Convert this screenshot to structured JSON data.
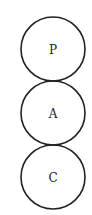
{
  "diagram": {
    "nodes": [
      {
        "id": "p",
        "label": "P",
        "cx": 53,
        "cy": 49,
        "r": 32
      },
      {
        "id": "a",
        "label": "A",
        "cx": 53,
        "cy": 113,
        "r": 32
      },
      {
        "id": "c",
        "label": "C",
        "cx": 53,
        "cy": 177,
        "r": 32
      }
    ],
    "stroke_color": "#222222",
    "background": "#ffffff"
  }
}
